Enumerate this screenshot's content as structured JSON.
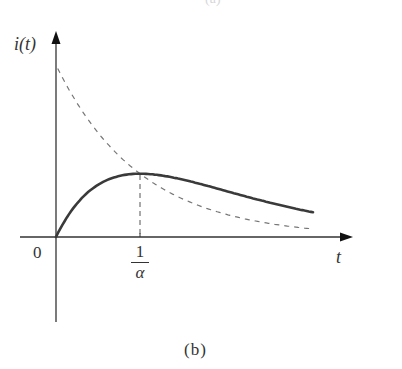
{
  "figure": {
    "top_cut_text": "(a)",
    "caption": "(b)",
    "y_axis_label": "i(t)",
    "x_axis_label": "t",
    "origin_label": "0",
    "tick_label": {
      "numerator": "1",
      "denominator": "α"
    }
  },
  "colors": {
    "axis": "#333333",
    "solid_curve": "#3a3a3a",
    "dashed_curve": "#777777"
  },
  "chart_data": {
    "type": "line",
    "title": "",
    "xlabel": "t",
    "ylabel": "i(t)",
    "x_ticks": [
      "0",
      "1/α"
    ],
    "grid": false,
    "legend": "none",
    "x_units": "multiples of 1/α",
    "series": [
      {
        "name": "i(t) (solid)",
        "style": "solid",
        "formula": "A·α·t·e^(−αt)",
        "x": [
          0,
          0.25,
          0.5,
          0.75,
          1.0,
          1.5,
          2.0,
          2.5,
          3.06
        ],
        "y": [
          0,
          0.195,
          0.303,
          0.354,
          0.368,
          0.335,
          0.271,
          0.205,
          0.144
        ]
      },
      {
        "name": "exponential envelope (dashed)",
        "style": "dashed",
        "formula": "A·e^(−αt)",
        "x": [
          0,
          0.25,
          0.5,
          0.75,
          1.0,
          1.5,
          2.0,
          2.5,
          3.06
        ],
        "y": [
          1.0,
          0.779,
          0.607,
          0.472,
          0.368,
          0.223,
          0.135,
          0.082,
          0.047
        ]
      }
    ],
    "annotations": [
      {
        "type": "vertical-dashed-line",
        "x": 1.0,
        "label": "1/α",
        "note": "peak of i(t) where curves intersect"
      }
    ],
    "xlim": [
      0,
      3.4
    ],
    "ylim": [
      -0.5,
      1.2
    ]
  }
}
